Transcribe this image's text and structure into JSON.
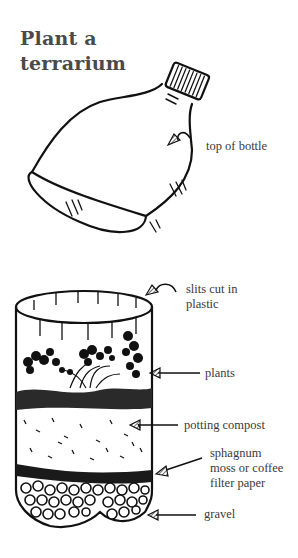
{
  "title": {
    "line1": "Plant a",
    "line2": "terrarium"
  },
  "labels": {
    "top_of_bottle": "top of bottle",
    "slits_1": "slits cut in",
    "slits_2": "plastic",
    "plants": "plants",
    "potting_compost": "potting compost",
    "sphagnum_1": "sphagnum",
    "sphagnum_2": "moss or coffee",
    "sphagnum_3": "filter paper",
    "gravel": "gravel"
  }
}
